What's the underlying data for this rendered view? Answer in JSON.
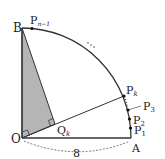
{
  "diagram": {
    "colors": {
      "line": "#333333",
      "shade": "#b5b5b5",
      "background": "#ffffff"
    },
    "points": {
      "O": {
        "label": "O",
        "x": 22,
        "y": 138
      },
      "A": {
        "label": "A",
        "x": 131,
        "y": 138
      },
      "B": {
        "label": "B",
        "x": 22,
        "y": 28
      },
      "P1": {
        "label": "P",
        "sub": "1",
        "x": 130.5,
        "y": 128
      },
      "P2": {
        "label": "P",
        "sub": "2",
        "x": 129.5,
        "y": 119
      },
      "P3": {
        "label": "P",
        "sub": "3",
        "x": 128,
        "y": 110
      },
      "Pk": {
        "label": "P",
        "sub": "k",
        "x": 124,
        "y": 96
      },
      "Pn1": {
        "label": "P",
        "sub": "n−1",
        "x": 32,
        "y": 28.5
      },
      "Qk": {
        "label": "Q",
        "sub": "k",
        "x": 55,
        "y": 124
      }
    },
    "radius_label": "8",
    "ellipsis": "…"
  }
}
